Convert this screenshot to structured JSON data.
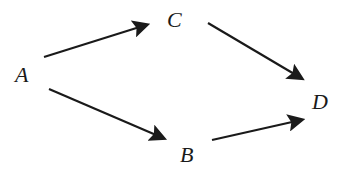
{
  "diagram": {
    "type": "directed-graph",
    "nodes": [
      {
        "id": "A",
        "label": "A"
      },
      {
        "id": "C",
        "label": "C"
      },
      {
        "id": "D",
        "label": "D"
      },
      {
        "id": "B",
        "label": "B"
      }
    ],
    "edges": [
      {
        "from": "A",
        "to": "C"
      },
      {
        "from": "A",
        "to": "B"
      },
      {
        "from": "C",
        "to": "D"
      },
      {
        "from": "B",
        "to": "D"
      }
    ],
    "colors": {
      "stroke": "#1a1a1a",
      "background": "#ffffff"
    }
  }
}
